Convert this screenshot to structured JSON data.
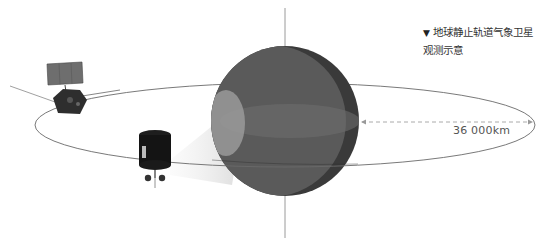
{
  "caption": {
    "marker": "▼",
    "line1": "地球静止轨道气象卫星",
    "line2": "观测示意"
  },
  "distance_label": "36 000km",
  "colors": {
    "earth_light": "#5a5a5a",
    "earth_dark": "#3a3a3a",
    "orbit_line": "#6a6a6a",
    "axis_line": "#9a9a9a",
    "beam": "#e8e8e8",
    "dash_arrow": "#aaaaaa"
  },
  "icons": {
    "satellite_top_left": "satellite-solar-panel-icon",
    "satellite_front": "satellite-cylinder-icon",
    "earth": "earth-globe-icon"
  }
}
